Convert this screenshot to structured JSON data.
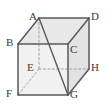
{
  "figure": {
    "name": "cube-diagram",
    "type": "geometry-solid",
    "shape": "cube",
    "projection": "oblique",
    "background_color": "#ffffff",
    "stroke_color": "#5a5a5a",
    "hidden_stroke_color": "#9a9a9a",
    "face_fill_top": "#e8e8e8",
    "face_fill_front": "#f0f0f0",
    "face_fill_right": "#e2e2e2",
    "label_color": "#3a3a3a"
  },
  "vertices": [
    {
      "id": "A",
      "label": "A",
      "x": 39,
      "y": 18,
      "label_x": 29,
      "label_y": 11,
      "hidden": false
    },
    {
      "id": "B",
      "label": "B",
      "x": 18,
      "y": 44,
      "label_x": 6,
      "label_y": 37,
      "hidden": false
    },
    {
      "id": "C",
      "label": "C",
      "x": 68,
      "y": 44,
      "label_x": 70,
      "label_y": 44,
      "hidden": false
    },
    {
      "id": "D",
      "label": "D",
      "x": 89,
      "y": 18,
      "label_x": 91,
      "label_y": 11,
      "hidden": false
    },
    {
      "id": "E",
      "label": "E",
      "x": 39,
      "y": 69,
      "label_x": 27,
      "label_y": 62,
      "hidden": true
    },
    {
      "id": "F",
      "label": "F",
      "x": 18,
      "y": 95,
      "label_x": 6,
      "label_y": 88,
      "hidden": false
    },
    {
      "id": "G",
      "label": "G",
      "x": 68,
      "y": 95,
      "label_x": 70,
      "label_y": 89,
      "hidden": false
    },
    {
      "id": "H",
      "label": "H",
      "x": 89,
      "y": 69,
      "label_x": 91,
      "label_y": 62,
      "hidden": false
    }
  ],
  "edges": [
    {
      "name": "edge-A-D",
      "from": "A",
      "to": "D",
      "style": "solid"
    },
    {
      "name": "edge-A-B",
      "from": "A",
      "to": "B",
      "style": "solid"
    },
    {
      "name": "edge-B-C",
      "from": "B",
      "to": "C",
      "style": "solid"
    },
    {
      "name": "edge-C-D",
      "from": "C",
      "to": "D",
      "style": "solid"
    },
    {
      "name": "edge-B-F",
      "from": "B",
      "to": "F",
      "style": "solid"
    },
    {
      "name": "edge-C-G",
      "from": "C",
      "to": "G",
      "style": "solid"
    },
    {
      "name": "edge-D-H",
      "from": "D",
      "to": "H",
      "style": "solid"
    },
    {
      "name": "edge-F-G",
      "from": "F",
      "to": "G",
      "style": "solid"
    },
    {
      "name": "edge-G-H",
      "from": "G",
      "to": "H",
      "style": "solid"
    },
    {
      "name": "edge-A-E",
      "from": "A",
      "to": "E",
      "style": "dashed"
    },
    {
      "name": "edge-E-F",
      "from": "E",
      "to": "F",
      "style": "dashed"
    },
    {
      "name": "edge-E-H",
      "from": "E",
      "to": "H",
      "style": "dashed"
    }
  ],
  "diagonals": [
    {
      "name": "diagonal-A-G",
      "from": "A",
      "to": "G",
      "style": "solid"
    }
  ],
  "faces": [
    {
      "name": "face-top-ABCD",
      "points": "39,18 89,18 68,44 18,44",
      "fill": "#e8e8e8"
    },
    {
      "name": "face-front-BCGF",
      "points": "18,44 68,44 68,95 18,95",
      "fill": "#f1f1f1"
    },
    {
      "name": "face-right-CDHG",
      "points": "68,44 89,18 89,69 68,95",
      "fill": "#e3e3e3"
    }
  ],
  "labels": {
    "A": "A",
    "B": "B",
    "C": "C",
    "D": "D",
    "E": "E",
    "F": "F",
    "G": "G",
    "H": "H"
  }
}
